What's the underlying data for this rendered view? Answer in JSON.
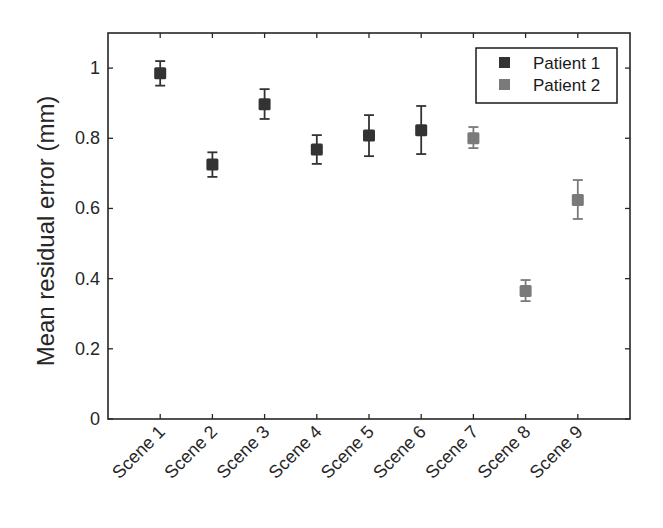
{
  "chart_data": {
    "type": "scatter",
    "subtype": "errorbar",
    "title": "",
    "xlabel": "",
    "ylabel": "Mean residual error (mm)",
    "categories": [
      "Scene 1",
      "Scene 2",
      "Scene 3",
      "Scene 4",
      "Scene 5",
      "Scene 6",
      "Scene 7",
      "Scene 8",
      "Scene 9"
    ],
    "ylim": [
      0,
      1.1
    ],
    "yticks": [
      0,
      0.2,
      0.4,
      0.6,
      0.8,
      1
    ],
    "ytick_labels": [
      "0",
      "0.2",
      "0.4",
      "0.6",
      "0.8",
      "1"
    ],
    "grid": false,
    "box": true,
    "legend_position": "top-right",
    "series": [
      {
        "name": "Patient 1",
        "color": "#333333",
        "points": [
          {
            "category": "Scene 1",
            "value": 0.985,
            "lower": 0.95,
            "upper": 1.02
          },
          {
            "category": "Scene 2",
            "value": 0.725,
            "lower": 0.69,
            "upper": 0.76
          },
          {
            "category": "Scene 3",
            "value": 0.897,
            "lower": 0.855,
            "upper": 0.94
          },
          {
            "category": "Scene 4",
            "value": 0.768,
            "lower": 0.727,
            "upper": 0.809
          },
          {
            "category": "Scene 5",
            "value": 0.808,
            "lower": 0.749,
            "upper": 0.866
          },
          {
            "category": "Scene 6",
            "value": 0.823,
            "lower": 0.755,
            "upper": 0.892
          }
        ]
      },
      {
        "name": "Patient 2",
        "color": "#7a7a7a",
        "points": [
          {
            "category": "Scene 7",
            "value": 0.8,
            "lower": 0.772,
            "upper": 0.832
          },
          {
            "category": "Scene 8",
            "value": 0.365,
            "lower": 0.336,
            "upper": 0.396
          },
          {
            "category": "Scene 9",
            "value": 0.624,
            "lower": 0.57,
            "upper": 0.681
          }
        ]
      }
    ]
  },
  "legend": {
    "items": [
      {
        "label": "Patient 1",
        "color": "#333333"
      },
      {
        "label": "Patient 2",
        "color": "#7a7a7a"
      }
    ]
  }
}
